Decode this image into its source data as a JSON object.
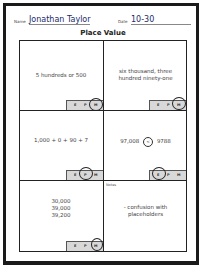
{
  "header": {
    "name_label": "Name",
    "name_value": "Jonathan Taylor",
    "date_label": "Date",
    "date_value": "10-30"
  },
  "title": "Place Value",
  "cells": [
    {
      "text_lines": [
        "5 hundreds or 500"
      ],
      "selector": {
        "options": [
          "E",
          "P",
          "M"
        ],
        "circled": "M"
      }
    },
    {
      "text_lines": [
        "six thousand, three",
        "hundred ninety-one"
      ],
      "selector": {
        "options": [
          "E",
          "P",
          "M"
        ],
        "circled": "M"
      }
    },
    {
      "text_lines": [
        "1,000 + 0 + 90 + 7"
      ],
      "selector": {
        "options": [
          "E",
          "P",
          "M"
        ],
        "circled": "P"
      }
    },
    {
      "text_lines": [
        "97,008",
        "<",
        "9788"
      ],
      "selector": {
        "options": [
          "E",
          "P",
          "M"
        ],
        "circled": "E"
      }
    },
    {
      "text_lines": [
        "30,000",
        "39,000",
        "39,200"
      ],
      "selector": {
        "options": [
          "E",
          "P",
          "M"
        ],
        "circled": "M"
      }
    }
  ],
  "notes": {
    "label": "Notes",
    "lines": [
      "- confusion with",
      "placeholders"
    ]
  }
}
